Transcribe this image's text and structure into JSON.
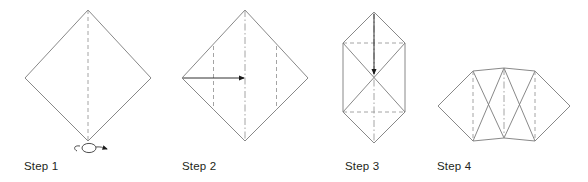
{
  "figure": {
    "kind": "origami-fold-instructions",
    "background_color": "#ffffff",
    "line_color": "#7a7a7a",
    "fold_line_color": "#9a9a9a",
    "arrow_color": "#1a1a1a",
    "label_color": "#231f20",
    "step_count": 4
  },
  "steps": [
    {
      "id": "step-1",
      "label": "Step 1",
      "shape": "square rotated 45 degrees (diamond)",
      "fold_lines": [
        "vertical center dashed valley fold"
      ],
      "symbol": "turn-over-loop-arrow",
      "symbol_meaning": "turn the paper over"
    },
    {
      "id": "step-2",
      "label": "Step 2",
      "shape": "square rotated 45 degrees (diamond)",
      "fold_lines": [
        "vertical center dash-dot axis",
        "vertical dashed fold at left quarter",
        "vertical dashed fold at right quarter"
      ],
      "symbol": "horizontal-right-arrow",
      "symbol_meaning": "fold left corner inward to the center"
    },
    {
      "id": "step-3",
      "label": "Step 3",
      "shape": "elongated hexagon with inner X cross",
      "fold_lines": [
        "vertical center dash-dot axis",
        "upper horizontal dashed fold",
        "lower horizontal dashed fold",
        "diagonal cross creases"
      ],
      "symbol": "vertical-down-arrow",
      "symbol_meaning": "fold top point down to the center"
    },
    {
      "id": "step-4",
      "label": "Step 4",
      "shape": "fan / bowtie with two side flaps and inner X cross",
      "fold_lines": [
        "vertical center dash-dot axis",
        "vertical dashed fold at left flap",
        "vertical dashed fold at right flap",
        "diagonal cross creases"
      ],
      "symbol": "none",
      "symbol_meaning": "resulting shape"
    }
  ]
}
